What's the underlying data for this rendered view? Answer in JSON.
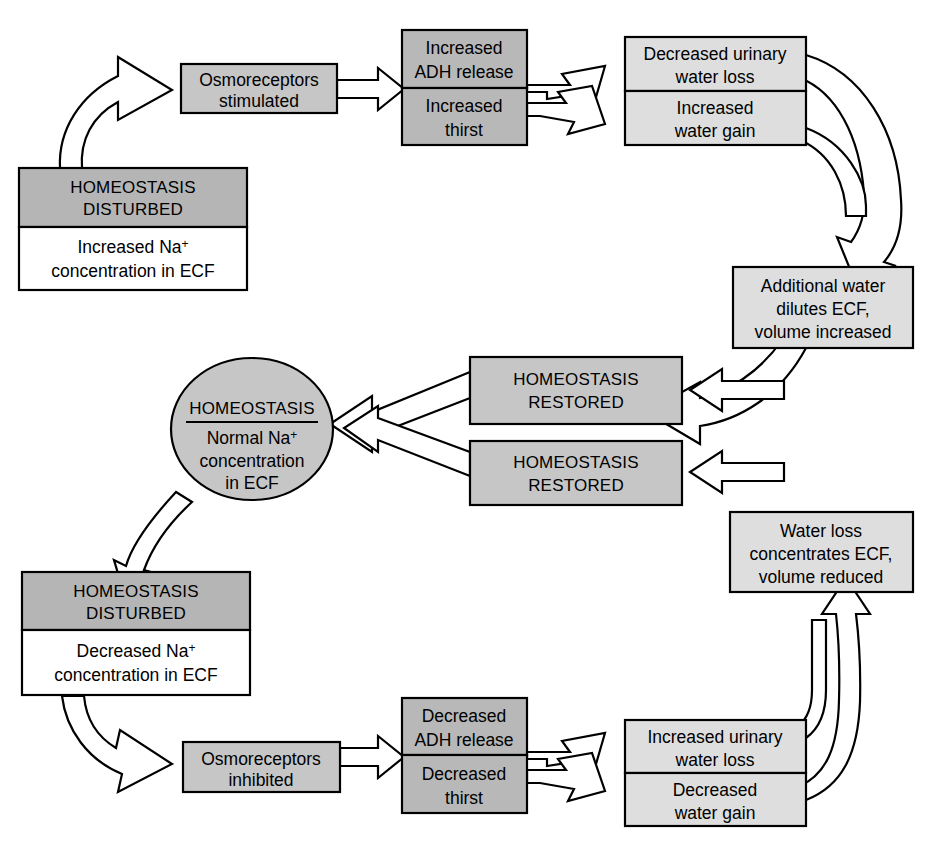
{
  "figure": {
    "kind": "physiology-flowchart"
  },
  "palette": {
    "page_background": "#ffffff",
    "box_fill_dark": "#b5b5b5",
    "box_fill_medium": "#c6c6c6",
    "box_fill_light": "#dedede",
    "box_fill_white": "#ffffff",
    "stroke": "#000000",
    "arrow_fill": "#ffffff"
  },
  "nodes": {
    "homeostasis_disturbed_high": {
      "header": "HOMEOSTASIS\nDISTURBED",
      "header_line1": "HOMEOSTASIS",
      "header_line2": "DISTURBED",
      "body_line1": "Increased Na",
      "body_superscript": "+",
      "body_line2": "concentration in ECF"
    },
    "osmoreceptors_stimulated": {
      "line1": "Osmoreceptors",
      "line2": "stimulated"
    },
    "adh_increase": {
      "top_line1": "Increased",
      "top_line2": "ADH release",
      "bottom_line1": "Increased",
      "bottom_line2": "thirst"
    },
    "water_gain_effects": {
      "top_line1": "Decreased urinary",
      "top_line2": "water loss",
      "bottom_line1": "Increased",
      "bottom_line2": "water gain"
    },
    "additional_water": {
      "line1": "Additional water",
      "line2": "dilutes ECF,",
      "line3": "volume increased"
    },
    "homeostasis_restored_upper": {
      "line1": "HOMEOSTASIS",
      "line2": "RESTORED"
    },
    "homeostasis_restored_lower": {
      "line1": "HOMEOSTASIS",
      "line2": "RESTORED"
    },
    "homeostasis_center": {
      "title": "HOMEOSTASIS",
      "body_line1": "Normal Na",
      "body_superscript": "+",
      "body_line2": "concentration",
      "body_line3": "in ECF"
    },
    "water_loss_concentrates": {
      "line1": "Water loss",
      "line2": "concentrates ECF,",
      "line3": "volume reduced"
    },
    "homeostasis_disturbed_low": {
      "header_line1": "HOMEOSTASIS",
      "header_line2": "DISTURBED",
      "body_line1": "Decreased Na",
      "body_superscript": "+",
      "body_line2": "concentration in ECF"
    },
    "osmoreceptors_inhibited": {
      "line1": "Osmoreceptors",
      "line2": "inhibited"
    },
    "adh_decrease": {
      "top_line1": "Decreased",
      "top_line2": "ADH release",
      "bottom_line1": "Decreased",
      "bottom_line2": "thirst"
    },
    "water_loss_effects": {
      "top_line1": "Increased urinary",
      "top_line2": "water loss",
      "bottom_line1": "Decreased",
      "bottom_line2": "water gain"
    }
  }
}
